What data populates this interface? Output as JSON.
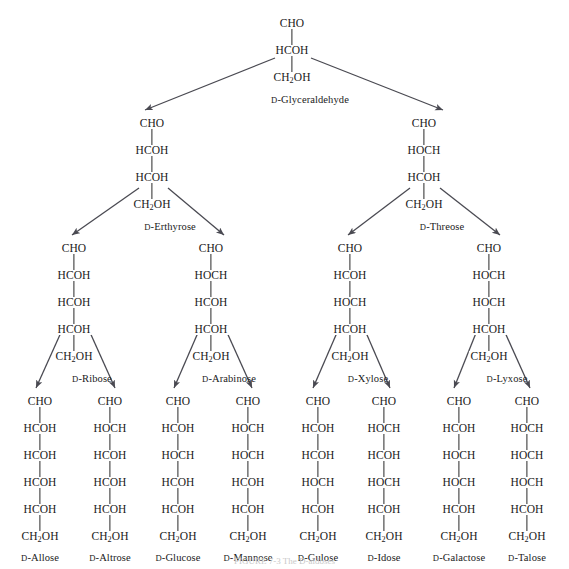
{
  "figure": {
    "caption": "FIGURE 7-3  The D-aldoses"
  },
  "chart_data": {
    "type": "diagram",
    "diagram_kind": "fischer-projection-family-tree",
    "levels": [
      "triose",
      "tetrose",
      "pentose",
      "hexose"
    ],
    "molecules": [
      {
        "id": "glyceraldehyde",
        "name": "D-Glyceraldehyde",
        "name_prefix": "D",
        "name_rest": "-Glyceraldehyde",
        "level": "triose",
        "carbons": 3,
        "rows": [
          "CHO",
          "HCOH",
          "CH2OH"
        ],
        "x": 292,
        "y": 18,
        "children": [
          "erythrose",
          "threose"
        ]
      },
      {
        "id": "erythrose",
        "name": "D-Erthyrose",
        "name_prefix": "D",
        "name_rest": "-Erthyrose",
        "level": "tetrose",
        "carbons": 4,
        "rows": [
          "CHO",
          "HCOH",
          "HCOH",
          "CH2OH"
        ],
        "x": 152,
        "y": 118,
        "children": [
          "ribose",
          "arabinose"
        ]
      },
      {
        "id": "threose",
        "name": "D-Threose",
        "name_prefix": "D",
        "name_rest": "-Threose",
        "level": "tetrose",
        "carbons": 4,
        "rows": [
          "CHO",
          "HOCH",
          "HCOH",
          "CH2OH"
        ],
        "x": 424,
        "y": 118,
        "children": [
          "xylose",
          "lyxose"
        ]
      },
      {
        "id": "ribose",
        "name": "D-Ribose",
        "name_prefix": "D",
        "name_rest": "-Ribose",
        "level": "pentose",
        "carbons": 5,
        "rows": [
          "CHO",
          "HCOH",
          "HCOH",
          "HCOH",
          "CH2OH"
        ],
        "x": 74,
        "y": 243,
        "children": [
          "allose",
          "altrose"
        ]
      },
      {
        "id": "arabinose",
        "name": "D-Arabinose",
        "name_prefix": "D",
        "name_rest": "-Arabinose",
        "level": "pentose",
        "carbons": 5,
        "rows": [
          "CHO",
          "HOCH",
          "HCOH",
          "HCOH",
          "CH2OH"
        ],
        "x": 211,
        "y": 243,
        "children": [
          "glucose",
          "mannose"
        ]
      },
      {
        "id": "xylose",
        "name": "D-Xylose",
        "name_prefix": "D",
        "name_rest": "-Xylose",
        "level": "pentose",
        "carbons": 5,
        "rows": [
          "CHO",
          "HCOH",
          "HOCH",
          "HCOH",
          "CH2OH"
        ],
        "x": 350,
        "y": 243,
        "children": [
          "gulose",
          "idose"
        ]
      },
      {
        "id": "lyxose",
        "name": "D-Lyxose",
        "name_prefix": "D",
        "name_rest": "-Lyxose",
        "level": "pentose",
        "carbons": 5,
        "rows": [
          "CHO",
          "HOCH",
          "HOCH",
          "HCOH",
          "CH2OH"
        ],
        "x": 489,
        "y": 243,
        "children": [
          "galactose",
          "talose"
        ]
      },
      {
        "id": "allose",
        "name": "D-Allose",
        "name_prefix": "D",
        "name_rest": "-Allose",
        "level": "hexose",
        "carbons": 6,
        "rows": [
          "CHO",
          "HCOH",
          "HCOH",
          "HCOH",
          "HCOH",
          "CH2OH"
        ],
        "x": 40,
        "y": 396,
        "children": []
      },
      {
        "id": "altrose",
        "name": "D-Altrose",
        "name_prefix": "D",
        "name_rest": "-Altrose",
        "level": "hexose",
        "carbons": 6,
        "rows": [
          "CHO",
          "HOCH",
          "HCOH",
          "HCOH",
          "HCOH",
          "CH2OH"
        ],
        "x": 110,
        "y": 396,
        "children": []
      },
      {
        "id": "glucose",
        "name": "D-Glucose",
        "name_prefix": "D",
        "name_rest": "-Glucose",
        "level": "hexose",
        "carbons": 6,
        "rows": [
          "CHO",
          "HCOH",
          "HOCH",
          "HCOH",
          "HCOH",
          "CH2OH"
        ],
        "x": 178,
        "y": 396,
        "children": []
      },
      {
        "id": "mannose",
        "name": "D-Mannose",
        "name_prefix": "D",
        "name_rest": "-Mannose",
        "level": "hexose",
        "carbons": 6,
        "rows": [
          "CHO",
          "HOCH",
          "HOCH",
          "HCOH",
          "HCOH",
          "CH2OH"
        ],
        "x": 248,
        "y": 396,
        "children": []
      },
      {
        "id": "gulose",
        "name": "D-Gulose",
        "name_prefix": "D",
        "name_rest": "-Gulose",
        "level": "hexose",
        "carbons": 6,
        "rows": [
          "CHO",
          "HCOH",
          "HCOH",
          "HOCH",
          "HCOH",
          "CH2OH"
        ],
        "x": 318,
        "y": 396,
        "children": []
      },
      {
        "id": "idose",
        "name": "D-Idose",
        "name_prefix": "D",
        "name_rest": "-Idose",
        "level": "hexose",
        "carbons": 6,
        "rows": [
          "CHO",
          "HOCH",
          "HCOH",
          "HOCH",
          "HCOH",
          "CH2OH"
        ],
        "x": 384,
        "y": 396,
        "children": []
      },
      {
        "id": "galactose",
        "name": "D-Galactose",
        "name_prefix": "D",
        "name_rest": "-Galactose",
        "level": "hexose",
        "carbons": 6,
        "rows": [
          "CHO",
          "HCOH",
          "HOCH",
          "HOCH",
          "HCOH",
          "CH2OH"
        ],
        "x": 459,
        "y": 396,
        "children": []
      },
      {
        "id": "talose",
        "name": "D-Talose",
        "name_prefix": "D",
        "name_rest": "-Talose",
        "level": "hexose",
        "carbons": 6,
        "rows": [
          "CHO",
          "HOCH",
          "HOCH",
          "HOCH",
          "HCOH",
          "CH2OH"
        ],
        "x": 527,
        "y": 396,
        "children": []
      }
    ],
    "arrows": [
      {
        "from": "glyceraldehyde",
        "to": "erythrose",
        "x1": 275,
        "y1": 58,
        "x2": 145,
        "y2": 110
      },
      {
        "from": "glyceraldehyde",
        "to": "threose",
        "x1": 311,
        "y1": 58,
        "x2": 443,
        "y2": 110
      },
      {
        "from": "erythrose",
        "to": "ribose",
        "x1": 139,
        "y1": 188,
        "x2": 72,
        "y2": 235
      },
      {
        "from": "erythrose",
        "to": "arabinose",
        "x1": 168,
        "y1": 188,
        "x2": 224,
        "y2": 235
      },
      {
        "from": "threose",
        "to": "xylose",
        "x1": 410,
        "y1": 188,
        "x2": 348,
        "y2": 235
      },
      {
        "from": "threose",
        "to": "lyxose",
        "x1": 440,
        "y1": 188,
        "x2": 500,
        "y2": 235
      },
      {
        "from": "ribose",
        "to": "allose",
        "x1": 63,
        "y1": 328,
        "x2": 36,
        "y2": 388
      },
      {
        "from": "ribose",
        "to": "altrose",
        "x1": 88,
        "y1": 328,
        "x2": 115,
        "y2": 388
      },
      {
        "from": "arabinose",
        "to": "glucose",
        "x1": 200,
        "y1": 328,
        "x2": 174,
        "y2": 388
      },
      {
        "from": "arabinose",
        "to": "mannose",
        "x1": 225,
        "y1": 328,
        "x2": 252,
        "y2": 388
      },
      {
        "from": "xylose",
        "to": "gulose",
        "x1": 339,
        "y1": 328,
        "x2": 313,
        "y2": 388
      },
      {
        "from": "xylose",
        "to": "idose",
        "x1": 364,
        "y1": 328,
        "x2": 390,
        "y2": 388
      },
      {
        "from": "lyxose",
        "to": "galactose",
        "x1": 478,
        "y1": 328,
        "x2": 454,
        "y2": 388
      },
      {
        "from": "lyxose",
        "to": "talose",
        "x1": 503,
        "y1": 328,
        "x2": 530,
        "y2": 388
      }
    ]
  },
  "style": {
    "bond_color": "#2a2a2a",
    "arrow_color": "#4a4a52",
    "text_color": "#1a1a1a",
    "background": "#ffffff"
  }
}
